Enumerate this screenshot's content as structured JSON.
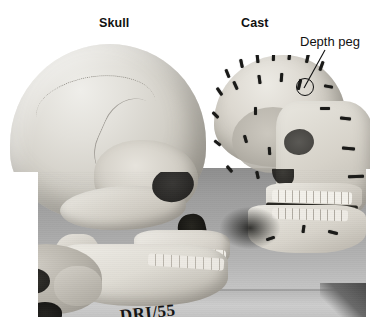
{
  "figure": {
    "kind": "photograph",
    "background_color": "#ffffff",
    "photo_tone": "grayscale"
  },
  "annotations": {
    "skull_label": "Skull",
    "cast_label": "Cast",
    "depth_peg_label": "Depth peg",
    "leader_line": "line from 'Depth peg' text to circled peg on cast forehead",
    "callout_marker": "circle",
    "text_color": "#111111"
  },
  "specimen": {
    "handwritten_code": "DRI/55",
    "marker_color": "#141414",
    "written_on": "mandible of skull"
  },
  "subjects": [
    {
      "name": "skull",
      "position": "left",
      "label": "Skull",
      "material": "bone",
      "tone": "#d4d0c8"
    },
    {
      "name": "cast",
      "position": "right",
      "label": "Cast",
      "material": "plaster cast with tissue-depth pegs",
      "tone": "#ddd9d1"
    },
    {
      "name": "partial-skull",
      "position": "bottom-left",
      "label": "",
      "material": "bone",
      "tone": "#b4b0a7"
    }
  ],
  "pegs": {
    "count_visible": 28,
    "color": "#1a1a18",
    "description": "small dark cylindrical tissue-depth markers protruding from the cast surface"
  },
  "scene": {
    "surface": "table top",
    "surface_tone": "#b4b4b4",
    "shadow_tone": "#4a4a4a"
  }
}
